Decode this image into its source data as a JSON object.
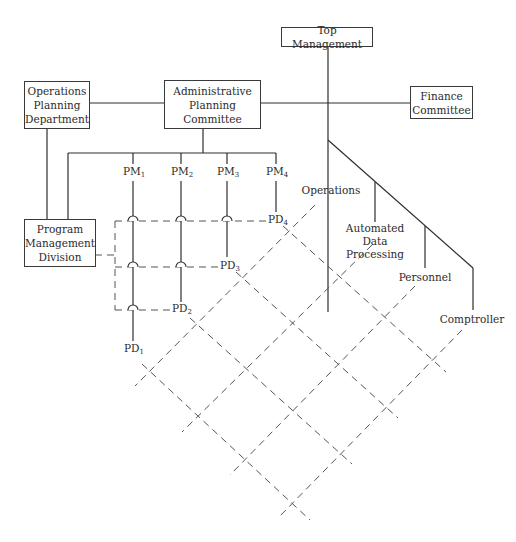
{
  "diagram": {
    "type": "matrix-organization-chart",
    "boxes": {
      "top_management": "Top Management",
      "operations_planning": "Operations\nPlanning\nDepartment",
      "administrative_planning": "Administrative\nPlanning\nCommittee",
      "finance_committee": "Finance\nCommittee",
      "program_management": "Program\nManagement\nDivision"
    },
    "functional_units": {
      "operations": "Operations",
      "adp": "Automated\nData\nProcessing",
      "personnel": "Personnel",
      "comptroller": "Comptroller"
    },
    "program_managers": [
      {
        "base": "PM",
        "sub": "1"
      },
      {
        "base": "PM",
        "sub": "2"
      },
      {
        "base": "PM",
        "sub": "3"
      },
      {
        "base": "PM",
        "sub": "4"
      }
    ],
    "program_directors": [
      {
        "base": "PD",
        "sub": "1"
      },
      {
        "base": "PD",
        "sub": "2"
      },
      {
        "base": "PD",
        "sub": "3"
      },
      {
        "base": "PD",
        "sub": "4"
      }
    ],
    "colors": {
      "line": "#2e2e2e",
      "dashed": "#555555",
      "text": "#2b2b2b",
      "background": "#ffffff"
    }
  }
}
